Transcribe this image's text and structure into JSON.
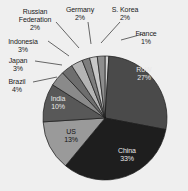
{
  "chart_data": {
    "type": "pie",
    "title": "",
    "subtitle": "",
    "xlabel": "",
    "ylabel": "",
    "grid": false,
    "legend": "none",
    "value_unit": "%",
    "total": 100,
    "start_angle_deg": 0,
    "direction": "clockwise",
    "categories": [
      "France",
      "RoW",
      "China",
      "US",
      "India",
      "Brazil",
      "Japan",
      "Indonesia",
      "Russian Federation",
      "Germany",
      "S. Korea"
    ],
    "values": [
      1,
      27,
      33,
      13,
      10,
      4,
      3,
      3,
      2,
      2,
      2
    ],
    "slices": [
      {
        "label": "France",
        "value": 1,
        "value_text": "1%",
        "color": "#d2d2d2",
        "label_placement": "outside",
        "label_x": 146,
        "label_y": 30,
        "leader": [
          121,
          40,
          143,
          34
        ]
      },
      {
        "label": "RoW",
        "value": 27,
        "value_text": "27%",
        "color": "#4a4a4a",
        "label_placement": "inside",
        "label_tone": "light",
        "label_x": 144,
        "label_y": 66
      },
      {
        "label": "China",
        "value": 33,
        "value_text": "33%",
        "color": "#1e1e1e",
        "label_placement": "inside",
        "label_tone": "light",
        "label_x": 127,
        "label_y": 147
      },
      {
        "label": "US",
        "value": 13,
        "value_text": "13%",
        "color": "#9a9a9a",
        "label_placement": "inside",
        "label_tone": "dark",
        "label_x": 71,
        "label_y": 128
      },
      {
        "label": "India",
        "value": 10,
        "value_text": "10%",
        "color": "#585858",
        "label_placement": "inside",
        "label_tone": "light",
        "label_x": 58,
        "label_y": 95
      },
      {
        "label": "Brazil",
        "value": 4,
        "value_text": "4%",
        "color": "#8a8a8a",
        "label_placement": "outside",
        "label_x": 17,
        "label_y": 78,
        "leader": [
          33,
          82,
          57,
          77
        ]
      },
      {
        "label": "Japan",
        "value": 3,
        "value_text": "3%",
        "color": "#6e6e6e",
        "label_placement": "outside",
        "label_x": 18,
        "label_y": 57,
        "leader": [
          35,
          61,
          62,
          65
        ]
      },
      {
        "label": "Indonesia",
        "value": 3,
        "value_text": "3%",
        "color": "#b4b4b4",
        "label_placement": "outside",
        "label_x": 23,
        "label_y": 38,
        "leader": [
          48,
          41,
          69,
          56
        ]
      },
      {
        "label": "Russian Federation",
        "value": 2,
        "value_text": "2%",
        "color": "#7e7e7e",
        "label_placement": "outside",
        "label_x": 35,
        "label_y": 8,
        "leader": [
          56,
          22,
          79,
          48
        ]
      },
      {
        "label": "Germany",
        "value": 2,
        "value_text": "2%",
        "color": "#c8c8c8",
        "label_placement": "outside",
        "label_x": 80,
        "label_y": 6,
        "leader": [
          88,
          22,
          91,
          44
        ]
      },
      {
        "label": "S. Korea",
        "value": 2,
        "value_text": "2%",
        "color": "#8e8e8e",
        "label_placement": "outside",
        "label_x": 125,
        "label_y": 6,
        "leader": [
          120,
          22,
          101,
          43
        ]
      }
    ],
    "geometry": {
      "center_x": 105,
      "center_y": 118,
      "radius": 62
    },
    "colors": {
      "background": "#efefef",
      "outline": "#1a1a1a",
      "leader_line": "#2a2a2a",
      "label_text": "#1a1a1a"
    }
  }
}
